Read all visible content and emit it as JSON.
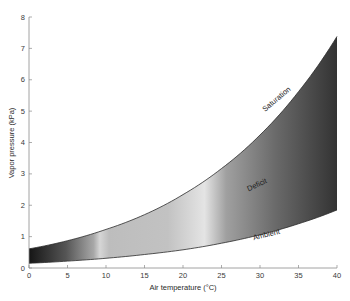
{
  "chart_data": {
    "type": "area",
    "title": "",
    "xlabel": "Air temperature (°C)",
    "ylabel": "Vapor pressure (kPa)",
    "xlim": [
      0,
      40
    ],
    "ylim": [
      0,
      8
    ],
    "xticks": [
      0,
      5,
      10,
      15,
      20,
      25,
      30,
      35,
      40
    ],
    "yticks": [
      0,
      1,
      2,
      3,
      4,
      5,
      6,
      7,
      8
    ],
    "grid": false,
    "legend": "none",
    "x": [
      0,
      5,
      10,
      15,
      20,
      25,
      30,
      35,
      40
    ],
    "series": [
      {
        "name": "Saturation",
        "values": [
          0.61,
          0.87,
          1.23,
          1.7,
          2.34,
          3.17,
          4.24,
          5.62,
          7.38
        ]
      },
      {
        "name": "Ambient",
        "values": [
          0.15,
          0.22,
          0.31,
          0.43,
          0.58,
          0.79,
          1.06,
          1.41,
          1.85
        ]
      }
    ],
    "fill_between": {
      "label": "Deficit",
      "upper": "Saturation",
      "lower": "Ambient",
      "style": "grayscale gradient"
    },
    "annotations": [
      {
        "text": "Saturation",
        "x": 32,
        "y": 5.3,
        "rotation": -40
      },
      {
        "text": "Deficit",
        "x": 29.5,
        "y": 2.6,
        "rotation": -25
      },
      {
        "text": "Ambient",
        "x": 30.5,
        "y": 1.0,
        "rotation": -15
      }
    ]
  },
  "colors": {
    "axis": "#7a7a7a",
    "text": "#333333",
    "curve": "#2a2a2a"
  }
}
